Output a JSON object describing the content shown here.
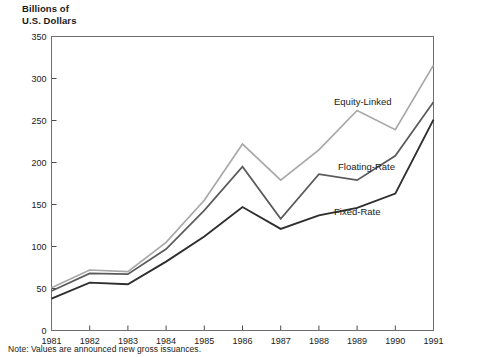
{
  "header": {
    "axis_title": "Billions of\nU.S. Dollars"
  },
  "footer": {
    "note": "Note: Values are announced new gross issuances."
  },
  "labels": {
    "equity": "Equity-Linked",
    "floating": "Floating-Rate",
    "fixed": "Fixed-Rate"
  },
  "colors": {
    "equity": "#a8a8a8",
    "floating": "#5a5a5a",
    "fixed": "#2e2e2e",
    "frame": "#6e6e6e"
  },
  "chart_data": {
    "type": "line",
    "title": "",
    "subtitle": "",
    "xlabel": "",
    "ylabel": "Billions of U.S. Dollars",
    "xlim": [
      1981,
      1991
    ],
    "ylim": [
      0,
      350
    ],
    "yticks": [
      0,
      50,
      100,
      150,
      200,
      250,
      300,
      350
    ],
    "ytick_labels": [
      "0",
      "50",
      "100",
      "150",
      "200",
      "250",
      "300",
      "350"
    ],
    "grid": false,
    "legend": "inline-labels",
    "note": "Note: Values are announced new gross issuances.",
    "categories": [
      1981,
      1982,
      1983,
      1984,
      1985,
      1986,
      1987,
      1988,
      1989,
      1990,
      1991
    ],
    "xtick_labels": [
      "1981",
      "1982",
      "1983",
      "1984",
      "1985",
      "1986",
      "1987",
      "1988",
      "1989",
      "1990",
      "1991"
    ],
    "series": [
      {
        "name": "Equity-Linked",
        "color": "#a8a8a8",
        "values": [
          51,
          72,
          70,
          105,
          155,
          222,
          179,
          215,
          262,
          239,
          316
        ]
      },
      {
        "name": "Floating-Rate",
        "color": "#5a5a5a",
        "values": [
          47,
          68,
          67,
          97,
          143,
          195,
          133,
          186,
          179,
          208,
          272
        ]
      },
      {
        "name": "Fixed-Rate",
        "color": "#2e2e2e",
        "values": [
          38,
          57,
          55,
          82,
          112,
          147,
          121,
          137,
          146,
          163,
          251
        ]
      }
    ]
  }
}
